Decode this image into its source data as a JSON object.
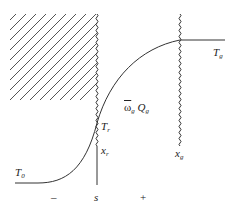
{
  "diagram": {
    "labels": {
      "T0": {
        "main": "T",
        "sub": "0"
      },
      "Tr": {
        "main": "T",
        "sub": "r"
      },
      "xr": {
        "main": "x",
        "sub": "r"
      },
      "Tg": {
        "main": "T",
        "sub": "g"
      },
      "xg": {
        "main": "x",
        "sub": "g"
      },
      "heat_release": {
        "omega": "ω",
        "omega_sub": "g",
        "q": "Q",
        "q_sub": "g"
      },
      "surface": "s",
      "minus": "–",
      "plus": "+"
    },
    "colors": {
      "line": "#333333",
      "hatch": "#555555",
      "background": "#ffffff"
    }
  }
}
